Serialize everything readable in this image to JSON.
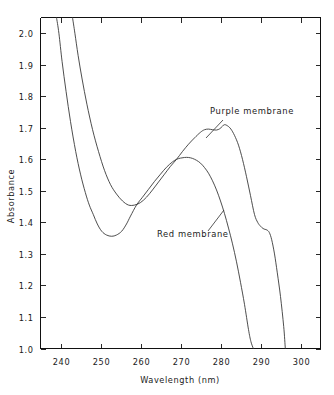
{
  "chart_data": {
    "type": "line",
    "title": "",
    "xlabel": "Wavelength (nm)",
    "ylabel": "Absorbance",
    "xlim": [
      235,
      305
    ],
    "ylim": [
      1.0,
      2.05
    ],
    "grid": false,
    "legend_position": "inline-annotation",
    "xticks": [
      240,
      250,
      260,
      270,
      280,
      290,
      300
    ],
    "xtick_labels": [
      "240",
      "250",
      "260",
      "270",
      "280",
      "290",
      "300"
    ],
    "yticks": [
      1.0,
      1.1,
      1.2,
      1.3,
      1.4,
      1.5,
      1.6,
      1.7,
      1.8,
      1.9,
      2.0
    ],
    "ytick_labels": [
      "1.0",
      "1.1",
      "1.2",
      "1.3",
      "1.4",
      "1.5",
      "1.6",
      "1.7",
      "1.8",
      "1.9",
      "2.0"
    ],
    "series": [
      {
        "name": "Purple membrane",
        "color": "#2e2e2e",
        "x": [
          243.0,
          243.6,
          244.4,
          245.4,
          246.6,
          248.0,
          249.5,
          251.0,
          252.5,
          254.0,
          255.5,
          257.0,
          258.5,
          260.0,
          261.5,
          263.0,
          264.5,
          266.0,
          267.5,
          269.0,
          270.5,
          272.0,
          273.5,
          275.0,
          276.0,
          277.0,
          278.0,
          279.0,
          279.8,
          280.4,
          281.0,
          281.8,
          282.6,
          283.5,
          284.5,
          285.5,
          286.5,
          287.5,
          288.5,
          289.3,
          290.0,
          290.6,
          291.1,
          291.6,
          292.2,
          292.8,
          293.5,
          294.2,
          295.0,
          295.8,
          296.2
        ],
        "y": [
          2.05,
          2.0,
          1.93,
          1.855,
          1.775,
          1.695,
          1.625,
          1.565,
          1.52,
          1.49,
          1.468,
          1.455,
          1.455,
          1.463,
          1.48,
          1.503,
          1.528,
          1.553,
          1.578,
          1.6,
          1.625,
          1.648,
          1.668,
          1.686,
          1.694,
          1.696,
          1.694,
          1.693,
          1.697,
          1.704,
          1.71,
          1.706,
          1.696,
          1.676,
          1.645,
          1.6,
          1.545,
          1.485,
          1.425,
          1.4,
          1.388,
          1.381,
          1.378,
          1.376,
          1.368,
          1.345,
          1.3,
          1.24,
          1.165,
          1.07,
          1.0
        ]
      },
      {
        "name": "Red membrane",
        "color": "#2e2e2e",
        "x": [
          239.0,
          239.6,
          240.4,
          241.4,
          242.5,
          243.8,
          245.0,
          246.2,
          247.2,
          248.2,
          249.2,
          250.3,
          251.5,
          252.8,
          254.0,
          255.3,
          256.5,
          257.5,
          259.0,
          260.5,
          262.0,
          263.5,
          265.0,
          266.5,
          268.0,
          269.0,
          270.0,
          271.0,
          272.0,
          273.0,
          274.0,
          275.0,
          276.0,
          277.0,
          278.0,
          279.0,
          280.0,
          281.0,
          282.0,
          283.0,
          284.0,
          285.0,
          286.0,
          287.0,
          287.6,
          288.2
        ],
        "y": [
          2.05,
          2.0,
          1.91,
          1.815,
          1.72,
          1.625,
          1.553,
          1.495,
          1.455,
          1.425,
          1.395,
          1.372,
          1.36,
          1.356,
          1.36,
          1.372,
          1.395,
          1.42,
          1.455,
          1.48,
          1.505,
          1.53,
          1.553,
          1.575,
          1.592,
          1.6,
          1.604,
          1.606,
          1.606,
          1.603,
          1.597,
          1.588,
          1.574,
          1.556,
          1.532,
          1.503,
          1.468,
          1.428,
          1.382,
          1.332,
          1.275,
          1.21,
          1.14,
          1.06,
          1.022,
          1.0
        ]
      }
    ],
    "annotations": [
      {
        "name": "purple-membrane",
        "text": "Purple membrane",
        "text_x": 210,
        "text_y": 114,
        "leader_from_x": 223,
        "leader_from_y": 120,
        "leader_to_x": 206,
        "leader_to_y": 138
      },
      {
        "name": "red-membrane",
        "text": "Red membrane",
        "text_x": 157,
        "text_y": 237,
        "leader_from_x": 208,
        "leader_from_y": 231,
        "leader_to_x": 224,
        "leader_to_y": 210
      }
    ]
  }
}
